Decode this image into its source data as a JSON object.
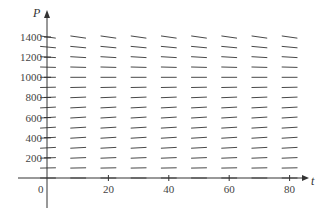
{
  "chart_data": {
    "type": "slope_field",
    "title": "",
    "equation_hint": "logistic: dP/dt = k P (1 - P/1000)",
    "xlabel": "t",
    "ylabel": "P",
    "xlim": [
      -15,
      88
    ],
    "ylim": [
      -200,
      1500
    ],
    "x_ticks": [
      0,
      20,
      40,
      60,
      80
    ],
    "x_tick_labels": [
      "0",
      "20",
      "40",
      "60",
      "80"
    ],
    "y_ticks": [
      200,
      400,
      600,
      800,
      1000,
      1200,
      1400
    ],
    "y_tick_labels": [
      "200",
      "400",
      "600",
      "800",
      "1000",
      "1200",
      "1400"
    ],
    "grid": false,
    "legend": null,
    "field": {
      "t_values": [
        0,
        10,
        20,
        30,
        40,
        50,
        60,
        70,
        80
      ],
      "P_values": [
        0,
        100,
        200,
        300,
        400,
        500,
        600,
        700,
        800,
        900,
        1000,
        1100,
        1200,
        1300,
        1400
      ],
      "k": 0.0075,
      "carrying_capacity": 1000
    }
  },
  "labels": {
    "origin": "0",
    "x_axis_name": "t",
    "y_axis_name": "P"
  },
  "colors": {
    "segment": "#333333",
    "axis": "#333333",
    "text": "#444444"
  }
}
